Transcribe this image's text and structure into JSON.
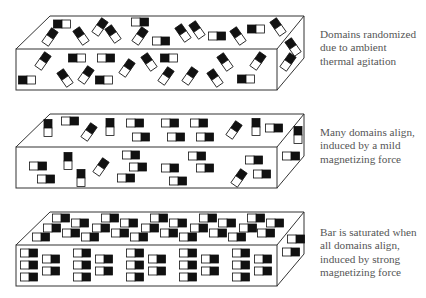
{
  "figure": {
    "colors": {
      "outline": "#333333",
      "domain_dark": "#111111",
      "domain_light": "#ffffff",
      "caption_text": "#555555"
    },
    "domain_size": {
      "w": 17,
      "h": 8
    },
    "panels": [
      {
        "id": "random",
        "caption_lines": [
          "Domains randomized",
          "due to ambient",
          "thermal agitation"
        ],
        "caption_pos": {
          "x": 320,
          "y": 28
        },
        "box": {
          "back_top": [
            [
              50,
              16
            ],
            [
              304,
              16
            ]
          ],
          "front": {
            "x1": 16,
            "y1": 49,
            "x2": 277,
            "y2": 90
          },
          "side_bottom": [
            304,
            58
          ]
        },
        "domains": [
          [
            62,
            24,
            0
          ],
          [
            50,
            37,
            125
          ],
          [
            81,
            36,
            55
          ],
          [
            100,
            27,
            125
          ],
          [
            113,
            34,
            55
          ],
          [
            140,
            22,
            180
          ],
          [
            140,
            36,
            125
          ],
          [
            161,
            41,
            180
          ],
          [
            183,
            33,
            55
          ],
          [
            197,
            30,
            55
          ],
          [
            217,
            36,
            180
          ],
          [
            238,
            36,
            55
          ],
          [
            256,
            29,
            0
          ],
          [
            278,
            27,
            55
          ],
          [
            43,
            61,
            125
          ],
          [
            77,
            58,
            0
          ],
          [
            106,
            58,
            180
          ],
          [
            127,
            68,
            125
          ],
          [
            149,
            62,
            55
          ],
          [
            169,
            58,
            0
          ],
          [
            225,
            62,
            55
          ],
          [
            258,
            61,
            125
          ],
          [
            27,
            80,
            0
          ],
          [
            65,
            78,
            55
          ],
          [
            86,
            75,
            125
          ],
          [
            104,
            80,
            0
          ],
          [
            166,
            76,
            125
          ],
          [
            190,
            76,
            125
          ],
          [
            215,
            78,
            55
          ],
          [
            246,
            79,
            0
          ],
          [
            293,
            47,
            55
          ],
          [
            288,
            62,
            125
          ]
        ]
      },
      {
        "id": "partial",
        "caption_lines": [
          "Many domains align,",
          "induced by a  mild",
          "magnetizing force"
        ],
        "caption_pos": {
          "x": 320,
          "y": 126
        },
        "box": {
          "back_top": [
            [
              50,
              114
            ],
            [
              304,
              114
            ]
          ],
          "front": {
            "x1": 16,
            "y1": 147,
            "x2": 277,
            "y2": 188
          },
          "side_bottom": [
            304,
            156
          ]
        },
        "domains": [
          [
            70,
            121,
            180
          ],
          [
            48,
            128,
            90
          ],
          [
            89,
            132,
            125
          ],
          [
            110,
            127,
            90
          ],
          [
            135,
            123,
            180
          ],
          [
            141,
            137,
            180
          ],
          [
            170,
            123,
            180
          ],
          [
            176,
            137,
            180
          ],
          [
            199,
            123,
            180
          ],
          [
            205,
            137,
            180
          ],
          [
            234,
            130,
            125
          ],
          [
            256,
            127,
            90
          ],
          [
            274,
            128,
            180
          ],
          [
            298,
            135,
            90
          ],
          [
            38,
            166,
            180
          ],
          [
            46,
            179,
            180
          ],
          [
            68,
            161,
            90
          ],
          [
            81,
            178,
            90
          ],
          [
            101,
            167,
            125
          ],
          [
            131,
            155,
            180
          ],
          [
            138,
            167,
            180
          ],
          [
            126,
            178,
            180
          ],
          [
            170,
            168,
            180
          ],
          [
            178,
            181,
            180
          ],
          [
            197,
            156,
            180
          ],
          [
            205,
            168,
            180
          ],
          [
            254,
            160,
            180
          ],
          [
            239,
            178,
            125
          ],
          [
            262,
            174,
            180
          ],
          [
            291,
            156,
            180
          ]
        ]
      },
      {
        "id": "saturated",
        "caption_lines": [
          "Bar is saturated when",
          "all domains align,",
          "induced by strong",
          "magnetizing force"
        ],
        "caption_pos": {
          "x": 320,
          "y": 226
        },
        "box": {
          "back_top": [
            [
              50,
              212
            ],
            [
              304,
              212
            ]
          ],
          "front": {
            "x1": 16,
            "y1": 245,
            "x2": 277,
            "y2": 286
          },
          "side_bottom": [
            304,
            254
          ]
        },
        "domains": [
          [
            61,
            218,
            180
          ],
          [
            110,
            218,
            180
          ],
          [
            159,
            218,
            180
          ],
          [
            208,
            218,
            180
          ],
          [
            256,
            218,
            180
          ],
          [
            80,
            223,
            180
          ],
          [
            129,
            223,
            180
          ],
          [
            178,
            223,
            180
          ],
          [
            227,
            223,
            180
          ],
          [
            275,
            223,
            180
          ],
          [
            52,
            228,
            180
          ],
          [
            101,
            228,
            180
          ],
          [
            150,
            228,
            180
          ],
          [
            199,
            228,
            180
          ],
          [
            248,
            228,
            180
          ],
          [
            41,
            237,
            180
          ],
          [
            71,
            233,
            180
          ],
          [
            90,
            237,
            180
          ],
          [
            120,
            233,
            180
          ],
          [
            139,
            237,
            180
          ],
          [
            169,
            233,
            180
          ],
          [
            188,
            237,
            180
          ],
          [
            218,
            233,
            180
          ],
          [
            237,
            237,
            180
          ],
          [
            266,
            233,
            180
          ],
          [
            29,
            253,
            180
          ],
          [
            29,
            265,
            180
          ],
          [
            29,
            277,
            180
          ],
          [
            51,
            259,
            180
          ],
          [
            51,
            271,
            180
          ],
          [
            82,
            253,
            180
          ],
          [
            82,
            265,
            180
          ],
          [
            82,
            277,
            180
          ],
          [
            104,
            259,
            180
          ],
          [
            104,
            271,
            180
          ],
          [
            135,
            253,
            180
          ],
          [
            135,
            265,
            180
          ],
          [
            135,
            277,
            180
          ],
          [
            157,
            259,
            180
          ],
          [
            157,
            271,
            180
          ],
          [
            188,
            253,
            180
          ],
          [
            188,
            265,
            180
          ],
          [
            188,
            277,
            180
          ],
          [
            210,
            259,
            180
          ],
          [
            210,
            271,
            180
          ],
          [
            241,
            253,
            180
          ],
          [
            241,
            265,
            180
          ],
          [
            241,
            277,
            180
          ],
          [
            263,
            259,
            180
          ],
          [
            263,
            271,
            180
          ],
          [
            296,
            239,
            180
          ],
          [
            291,
            252,
            180
          ]
        ]
      }
    ]
  }
}
